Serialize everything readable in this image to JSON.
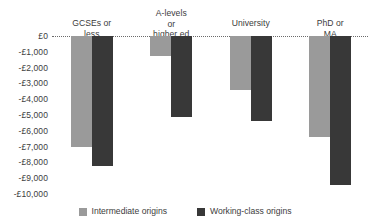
{
  "chart_data": {
    "type": "bar",
    "title": "",
    "xlabel": "",
    "ylabel": "",
    "categories": [
      "GCSEs or less",
      "A-levels or\nhigher ed",
      "University",
      "PhD or MA"
    ],
    "series": [
      {
        "name": "Intermediate origins",
        "color": "#9a9a9a",
        "values": [
          -7000,
          -1250,
          -3400,
          -6400
        ]
      },
      {
        "name": "Working-class origins",
        "color": "#383838",
        "values": [
          -8200,
          -5100,
          -5400,
          -9400
        ]
      }
    ],
    "ylim": [
      -10000,
      0
    ],
    "yticks": [
      0,
      -1000,
      -2000,
      -3000,
      -4000,
      -5000,
      -6000,
      -7000,
      -8000,
      -9000,
      -10000
    ],
    "ytick_labels": [
      "£0",
      "-£1,000",
      "-£2,000",
      "-£3,000",
      "-£4,000",
      "-£5,000",
      "-£6,000",
      "-£7,000",
      "-£8,000",
      "-£9,000",
      "-£10,000"
    ],
    "grid": false,
    "zero_line": true,
    "zero_line_style": "dotted",
    "legend_position": "bottom",
    "category_label_position": "top"
  }
}
